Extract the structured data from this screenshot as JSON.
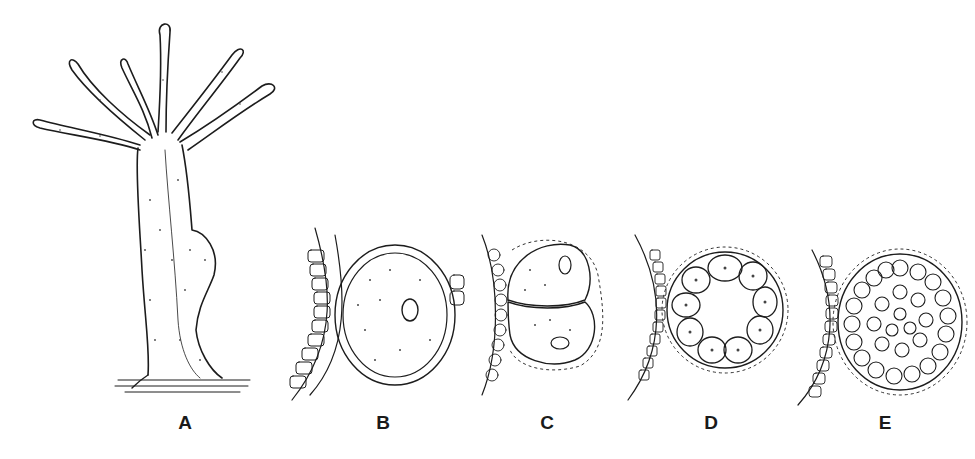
{
  "figure": {
    "panels": [
      {
        "id": "A",
        "label": "A",
        "subject": "hydra-polyp-with-bud"
      },
      {
        "id": "B",
        "label": "B",
        "subject": "egg-with-follicle-layer"
      },
      {
        "id": "C",
        "label": "C",
        "subject": "two-cell-stage"
      },
      {
        "id": "D",
        "label": "D",
        "subject": "blastula-ring"
      },
      {
        "id": "E",
        "label": "E",
        "subject": "solid-morula"
      }
    ]
  },
  "colors": {
    "ink": "#1c1c1c",
    "background": "#ffffff"
  }
}
